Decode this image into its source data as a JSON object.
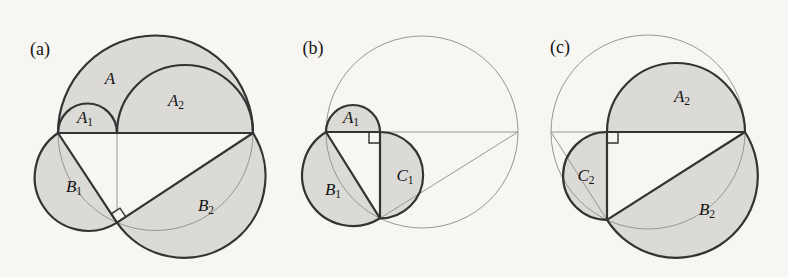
{
  "colors": {
    "paper": "#f7f6f2",
    "shade": "#dbdad6",
    "ink": "#333333",
    "faint": "#98968f",
    "text": "#141414"
  },
  "panels": [
    {
      "label": "(a)",
      "regions": [
        {
          "base": "A",
          "sub": ""
        },
        {
          "base": "A",
          "sub": "2"
        },
        {
          "base": "A",
          "sub": "1"
        },
        {
          "base": "B",
          "sub": "1"
        },
        {
          "base": "B",
          "sub": "2"
        }
      ]
    },
    {
      "label": "(b)",
      "regions": [
        {
          "base": "A",
          "sub": "1"
        },
        {
          "base": "B",
          "sub": "1"
        },
        {
          "base": "C",
          "sub": "1"
        }
      ]
    },
    {
      "label": "(c)",
      "regions": [
        {
          "base": "A",
          "sub": "2"
        },
        {
          "base": "C",
          "sub": "2"
        },
        {
          "base": "B",
          "sub": "2"
        }
      ]
    }
  ]
}
